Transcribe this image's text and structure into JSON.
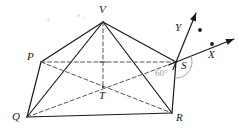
{
  "figure": {
    "type": "geometric-solid-diagram",
    "background_color": "#ffffff",
    "stroke_color": "#1a1a1a",
    "dash_color": "#555555",
    "angle_color": "#9a9a9a",
    "width": 239,
    "height": 131
  },
  "vertices": [
    {
      "id": "V",
      "label": "V",
      "x": 103,
      "y": 22,
      "label_x": 99,
      "label_y": 4,
      "kind": "apex"
    },
    {
      "id": "P",
      "label": "P",
      "x": 41,
      "y": 62,
      "label_x": 27,
      "label_y": 51,
      "kind": "base"
    },
    {
      "id": "Q",
      "label": "Q",
      "x": 27,
      "y": 117,
      "label_x": 12,
      "label_y": 111,
      "kind": "base"
    },
    {
      "id": "R",
      "label": "R",
      "x": 172,
      "y": 113,
      "label_x": 176,
      "label_y": 112,
      "kind": "base"
    },
    {
      "id": "S",
      "label": "S",
      "x": 176,
      "y": 62,
      "label_x": 181,
      "label_y": 60,
      "kind": "base"
    },
    {
      "id": "T",
      "label": "T",
      "x": 103,
      "y": 87,
      "label_x": 99,
      "label_y": 90,
      "kind": "center"
    }
  ],
  "solid_edges": [
    {
      "name": "edge-V-P",
      "from": "V",
      "to": "P"
    },
    {
      "name": "edge-V-Q",
      "from": "V",
      "to": "Q"
    },
    {
      "name": "edge-V-R",
      "from": "V",
      "to": "R"
    },
    {
      "name": "edge-V-S",
      "from": "V",
      "to": "S"
    },
    {
      "name": "edge-P-Q",
      "from": "P",
      "to": "Q"
    },
    {
      "name": "edge-Q-R",
      "from": "Q",
      "to": "R"
    },
    {
      "name": "edge-R-S",
      "from": "R",
      "to": "S"
    }
  ],
  "dashed_edges": [
    {
      "name": "edge-P-S",
      "from": "P",
      "to": "S"
    },
    {
      "name": "diagonal-Q-S",
      "from": "Q",
      "to": "S"
    },
    {
      "name": "diagonal-P-R",
      "from": "P",
      "to": "R"
    },
    {
      "name": "altitude-V-T",
      "from": "V",
      "to": "T"
    }
  ],
  "axes": {
    "origin": {
      "x": 176,
      "y": 62
    },
    "x_axis": {
      "label": "X",
      "label_x": 208,
      "label_y": 49,
      "tip_x": 234,
      "tip_y": 39,
      "dot_x": 212,
      "dot_y": 44
    },
    "y_axis": {
      "label": "Y",
      "label_x": 175,
      "label_y": 22,
      "tip_x": 196,
      "tip_y": 13,
      "dot_x": 200,
      "dot_y": 30
    }
  },
  "angles": [
    {
      "name": "angle-60",
      "label": "60°",
      "x": 155,
      "y": 69,
      "arc_cx": 176,
      "arc_cy": 62
    }
  ],
  "specks": [
    {
      "x": 47,
      "y": 18,
      "d": 3
    },
    {
      "x": 77,
      "y": 14,
      "d": 3
    },
    {
      "x": 83,
      "y": 17,
      "d": 2
    }
  ]
}
